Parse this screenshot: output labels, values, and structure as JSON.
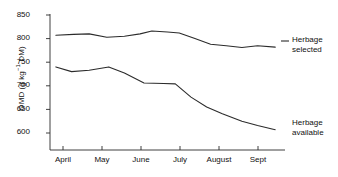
{
  "chart_data": {
    "type": "line",
    "title": "",
    "xlabel": "",
    "ylabel": "OMD (g kg",
    "ylabel_sup": "−1",
    "ylabel_tail": " DM)",
    "categories": [
      "April",
      "May",
      "June",
      "July",
      "August",
      "Sept"
    ],
    "xtick_labels": [
      "April",
      "May",
      "June",
      "July",
      "August",
      "Sept"
    ],
    "ytick_labels": [
      "850",
      "800",
      "750",
      "700",
      "650",
      "600"
    ],
    "ytick_values": [
      850,
      800,
      750,
      700,
      650,
      600
    ],
    "ylim": [
      580,
      860
    ],
    "xlim": [
      0,
      6
    ],
    "grid": false,
    "legend_position": "right-inline",
    "series": [
      {
        "name": "Herbage selected",
        "label_line1": "Herbage",
        "label_line2": "selected",
        "color": "#2b2b2b",
        "x": [
          0.15,
          0.6,
          1.0,
          1.45,
          1.9,
          2.3,
          2.6,
          3.0,
          3.3,
          3.7,
          4.1,
          4.5,
          4.9,
          5.3,
          5.75
        ],
        "values": [
          807,
          809,
          810,
          803,
          805,
          810,
          816,
          814,
          812,
          800,
          788,
          785,
          781,
          785,
          782
        ]
      },
      {
        "name": "Herbage available",
        "label_line1": "Herbage",
        "label_line2": "available",
        "color": "#2b2b2b",
        "x": [
          0.15,
          0.55,
          1.0,
          1.5,
          1.9,
          2.4,
          2.9,
          3.2,
          3.6,
          4.0,
          4.4,
          4.9,
          5.3,
          5.75
        ],
        "values": [
          740,
          730,
          733,
          740,
          727,
          706,
          705,
          704,
          676,
          655,
          641,
          625,
          616,
          607
        ]
      }
    ]
  },
  "axes": {
    "y_axis_name": "y-axis",
    "x_axis_name": "x-axis"
  }
}
